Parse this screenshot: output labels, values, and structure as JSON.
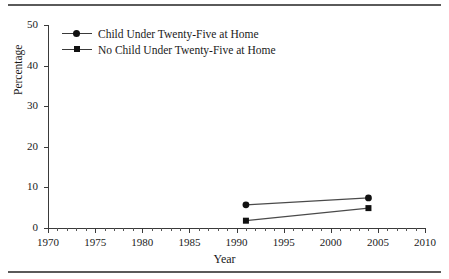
{
  "chart_data": {
    "type": "line",
    "title": "",
    "xlabel": "Year",
    "ylabel": "Percentage",
    "xlim": [
      1970,
      2010
    ],
    "ylim": [
      0,
      50
    ],
    "xticks": [
      1970,
      1975,
      1980,
      1985,
      1990,
      1995,
      2000,
      2005,
      2010
    ],
    "xtick_labels": [
      "1970",
      "1975",
      "1980",
      "1985",
      "1990",
      "1995",
      "2000",
      "2005",
      "2010"
    ],
    "xminor_step": 1,
    "yticks": [
      0,
      10,
      20,
      30,
      40,
      50
    ],
    "ytick_labels": [
      "0",
      "10",
      "20",
      "30",
      "40",
      "50"
    ],
    "grid": false,
    "legend_position": "top-left",
    "x": [
      1991,
      2004
    ],
    "series": [
      {
        "name": "Child Under Twenty-Five at Home",
        "marker": "circle",
        "values": [
          5.7,
          7.4
        ]
      },
      {
        "name": "No Child Under Twenty-Five at Home",
        "marker": "square",
        "values": [
          1.8,
          4.9
        ]
      }
    ]
  },
  "figure": {
    "top_rule": "",
    "bottom_rule": ""
  }
}
